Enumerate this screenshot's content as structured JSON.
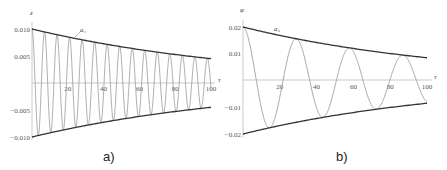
{
  "chart_data": [
    {
      "type": "line",
      "panel_label": "a)",
      "xlabel": "τ",
      "ylabel": "z",
      "xlim": [
        0,
        100
      ],
      "ylim": [
        -0.01,
        0.01
      ],
      "x_ticks": [
        "20",
        "40",
        "60",
        "80",
        "100"
      ],
      "y_ticks": [
        "0.010",
        "0.005",
        "-0.005",
        "-0.010"
      ],
      "annotation": "a₁",
      "grid": false,
      "series": [
        {
          "name": "z(τ) oscillation",
          "amplitude0": 0.01,
          "amplitude100": 0.0045,
          "period": 7.0,
          "color": "#999999"
        },
        {
          "name": "upper envelope a₁",
          "x": [
            0,
            20,
            40,
            60,
            80,
            100
          ],
          "values": [
            0.01,
            0.0082,
            0.0069,
            0.0058,
            0.0051,
            0.0045
          ],
          "color": "#333333"
        },
        {
          "name": "lower envelope",
          "x": [
            0,
            20,
            40,
            60,
            80,
            100
          ],
          "values": [
            -0.01,
            -0.0082,
            -0.0069,
            -0.0058,
            -0.0051,
            -0.0045
          ],
          "color": "#333333"
        }
      ]
    },
    {
      "type": "line",
      "panel_label": "b)",
      "xlabel": "τ",
      "ylabel": "φ",
      "xlim": [
        0,
        100
      ],
      "ylim": [
        -0.02,
        0.02
      ],
      "x_ticks": [
        "20",
        "40",
        "60",
        "80",
        "100"
      ],
      "y_ticks": [
        "0.02",
        "0.01",
        "-0.01",
        "-0.02"
      ],
      "annotation": "a₂",
      "grid": false,
      "series": [
        {
          "name": "φ(τ) oscillation",
          "amplitude0": 0.02,
          "amplitude100": 0.0085,
          "period": 29.0,
          "color": "#999999"
        },
        {
          "name": "upper envelope a₂",
          "x": [
            0,
            20,
            40,
            60,
            80,
            100
          ],
          "values": [
            0.02,
            0.0165,
            0.0138,
            0.0117,
            0.01,
            0.0086
          ],
          "color": "#333333"
        },
        {
          "name": "lower envelope",
          "x": [
            0,
            20,
            40,
            60,
            80,
            100
          ],
          "values": [
            -0.02,
            -0.0165,
            -0.0138,
            -0.0117,
            -0.01,
            -0.0086
          ],
          "color": "#333333"
        }
      ]
    }
  ],
  "captions": {
    "a": "a)",
    "b": "b)"
  }
}
